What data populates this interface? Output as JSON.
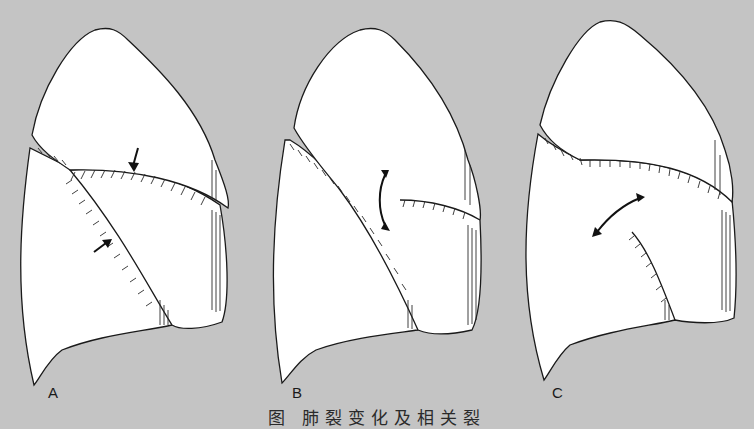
{
  "figure": {
    "background_color": "#c4c4c4",
    "panels": [
      {
        "label": "A",
        "arrows": "two straight arrows pointing at fissures"
      },
      {
        "label": "B",
        "arrows": "vertical double-headed curved arrow"
      },
      {
        "label": "C",
        "arrows": "diagonal double-headed curved arrow"
      }
    ],
    "caption": "图 肺裂变化及相关裂"
  }
}
